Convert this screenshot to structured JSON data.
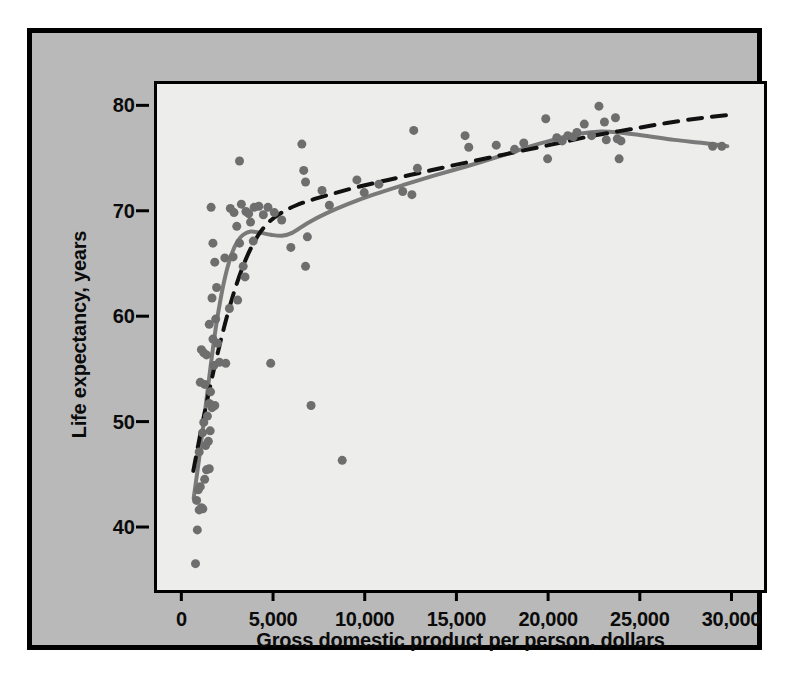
{
  "figure": {
    "background_color": "#b9b9b9",
    "plot_background_color": "#ededeb",
    "border_color": "#000000",
    "point_color": "#6e6e6e",
    "fit_line_color": "#7a7a7a",
    "dashed_line_color": "#111111"
  },
  "axes": {
    "x_ticks": [
      "0",
      "5,000",
      "10,000",
      "15,000",
      "20,000",
      "25,000",
      "30,000"
    ],
    "y_ticks": [
      "40",
      "50",
      "60",
      "70",
      "80"
    ],
    "x_title": "Gross domestic product per person, dollars",
    "y_title": "Life expectancy, years"
  },
  "chart_data": {
    "type": "scatter",
    "title": "",
    "xlabel": "Gross domestic product per person, dollars",
    "ylabel": "Life expectancy, years",
    "xlim": [
      -1600,
      31500
    ],
    "ylim": [
      34.5,
      82.5
    ],
    "xticks": [
      0,
      5000,
      10000,
      15000,
      20000,
      25000,
      30000
    ],
    "xticklabels": [
      "0",
      "5,000",
      "10,000",
      "15,000",
      "20,000",
      "25,000",
      "30,000"
    ],
    "yticks": [
      40,
      50,
      60,
      70,
      80
    ],
    "yticklabels": [
      "40",
      "50",
      "60",
      "70",
      "80"
    ],
    "grid": false,
    "legend": null,
    "marker": {
      "shape": "circle",
      "size": 9,
      "color": "#6e6e6e"
    },
    "points": [
      [
        500,
        37.0
      ],
      [
        600,
        40.2
      ],
      [
        700,
        42.1
      ],
      [
        820,
        42.3
      ],
      [
        560,
        43.0
      ],
      [
        900,
        42.2
      ],
      [
        650,
        44.0
      ],
      [
        760,
        44.3
      ],
      [
        1000,
        45.0
      ],
      [
        1100,
        45.9
      ],
      [
        1250,
        46.0
      ],
      [
        700,
        47.6
      ],
      [
        1050,
        48.2
      ],
      [
        1200,
        48.6
      ],
      [
        880,
        49.4
      ],
      [
        1300,
        49.6
      ],
      [
        950,
        50.4
      ],
      [
        1150,
        51.0
      ],
      [
        1400,
        51.8
      ],
      [
        1550,
        52.0
      ],
      [
        1250,
        52.2
      ],
      [
        760,
        54.2
      ],
      [
        1000,
        54.0
      ],
      [
        1320,
        53.3
      ],
      [
        1500,
        55.8
      ],
      [
        1800,
        56.1
      ],
      [
        950,
        57.0
      ],
      [
        820,
        57.3
      ],
      [
        1100,
        56.8
      ],
      [
        1700,
        57.9
      ],
      [
        2150,
        56.0
      ],
      [
        1450,
        58.3
      ],
      [
        4600,
        56.0
      ],
      [
        1250,
        59.7
      ],
      [
        1600,
        60.2
      ],
      [
        2350,
        61.2
      ],
      [
        1400,
        62.2
      ],
      [
        1650,
        63.2
      ],
      [
        2800,
        62.0
      ],
      [
        1550,
        65.6
      ],
      [
        3200,
        64.2
      ],
      [
        2100,
        66.0
      ],
      [
        1450,
        67.4
      ],
      [
        2550,
        66.1
      ],
      [
        3100,
        65.2
      ],
      [
        2900,
        67.4
      ],
      [
        3650,
        67.6
      ],
      [
        5700,
        67.0
      ],
      [
        1350,
        70.8
      ],
      [
        2400,
        70.7
      ],
      [
        2600,
        70.3
      ],
      [
        3000,
        71.1
      ],
      [
        3250,
        70.4
      ],
      [
        3400,
        70.2
      ],
      [
        3700,
        70.8
      ],
      [
        3950,
        70.9
      ],
      [
        4200,
        70.1
      ],
      [
        4450,
        70.8
      ],
      [
        2750,
        69.0
      ],
      [
        3500,
        69.4
      ],
      [
        4800,
        70.3
      ],
      [
        5200,
        69.6
      ],
      [
        6600,
        68.0
      ],
      [
        2900,
        75.2
      ],
      [
        6400,
        74.3
      ],
      [
        6500,
        73.2
      ],
      [
        6300,
        76.8
      ],
      [
        6500,
        65.2
      ],
      [
        6800,
        52.0
      ],
      [
        8500,
        46.8
      ],
      [
        7400,
        72.4
      ],
      [
        7800,
        71.0
      ],
      [
        9300,
        73.4
      ],
      [
        9700,
        72.2
      ],
      [
        10500,
        73.0
      ],
      [
        11800,
        72.3
      ],
      [
        12400,
        78.1
      ],
      [
        12600,
        74.5
      ],
      [
        12300,
        72.0
      ],
      [
        15200,
        77.6
      ],
      [
        15400,
        76.5
      ],
      [
        16900,
        76.7
      ],
      [
        17900,
        76.3
      ],
      [
        18400,
        76.9
      ],
      [
        19600,
        79.2
      ],
      [
        19700,
        75.4
      ],
      [
        20200,
        77.4
      ],
      [
        20500,
        77.1
      ],
      [
        20800,
        77.6
      ],
      [
        21100,
        77.5
      ],
      [
        21300,
        77.9
      ],
      [
        21700,
        78.7
      ],
      [
        22100,
        77.6
      ],
      [
        22500,
        80.4
      ],
      [
        22800,
        78.9
      ],
      [
        22900,
        77.2
      ],
      [
        23400,
        79.3
      ],
      [
        23500,
        77.3
      ],
      [
        23600,
        75.4
      ],
      [
        23700,
        77.1
      ],
      [
        28700,
        76.6
      ],
      [
        29200,
        76.6
      ]
    ],
    "series": [
      {
        "name": "smooth-fit",
        "style": "solid",
        "color": "#7a7a7a",
        "width": 4,
        "points": [
          [
            400,
            43.2
          ],
          [
            700,
            47.0
          ],
          [
            1000,
            51.2
          ],
          [
            1300,
            55.4
          ],
          [
            1600,
            59.3
          ],
          [
            1900,
            62.4
          ],
          [
            2200,
            64.8
          ],
          [
            2500,
            66.5
          ],
          [
            2800,
            67.6
          ],
          [
            3100,
            68.2
          ],
          [
            3500,
            68.5
          ],
          [
            4000,
            68.4
          ],
          [
            4600,
            68.2
          ],
          [
            5200,
            68.1
          ],
          [
            5800,
            68.4
          ],
          [
            6600,
            69.3
          ],
          [
            7600,
            70.2
          ],
          [
            8800,
            71.1
          ],
          [
            10200,
            72.0
          ],
          [
            11800,
            72.9
          ],
          [
            13500,
            73.8
          ],
          [
            15300,
            74.7
          ],
          [
            17200,
            75.7
          ],
          [
            18800,
            76.6
          ],
          [
            20200,
            77.3
          ],
          [
            21500,
            77.8
          ],
          [
            22600,
            78.0
          ],
          [
            23600,
            77.9
          ],
          [
            25000,
            77.6
          ],
          [
            26600,
            77.2
          ],
          [
            28200,
            76.9
          ],
          [
            29500,
            76.6
          ]
        ]
      },
      {
        "name": "polynomial-fit",
        "style": "dashed",
        "color": "#111111",
        "width": 4,
        "dash": "14 10",
        "points": [
          [
            380,
            45.8
          ],
          [
            900,
            50.5
          ],
          [
            1500,
            55.4
          ],
          [
            2100,
            59.7
          ],
          [
            2700,
            63.3
          ],
          [
            3300,
            66.1
          ],
          [
            3900,
            68.1
          ],
          [
            4500,
            69.4
          ],
          [
            5200,
            70.3
          ],
          [
            6000,
            71.0
          ],
          [
            7000,
            71.6
          ],
          [
            8200,
            72.2
          ],
          [
            9500,
            72.8
          ],
          [
            11000,
            73.4
          ],
          [
            12800,
            74.1
          ],
          [
            14600,
            74.8
          ],
          [
            16500,
            75.5
          ],
          [
            18400,
            76.2
          ],
          [
            20300,
            76.9
          ],
          [
            22200,
            77.6
          ],
          [
            24200,
            78.2
          ],
          [
            26200,
            78.8
          ],
          [
            28200,
            79.3
          ],
          [
            29800,
            79.6
          ]
        ]
      }
    ]
  }
}
